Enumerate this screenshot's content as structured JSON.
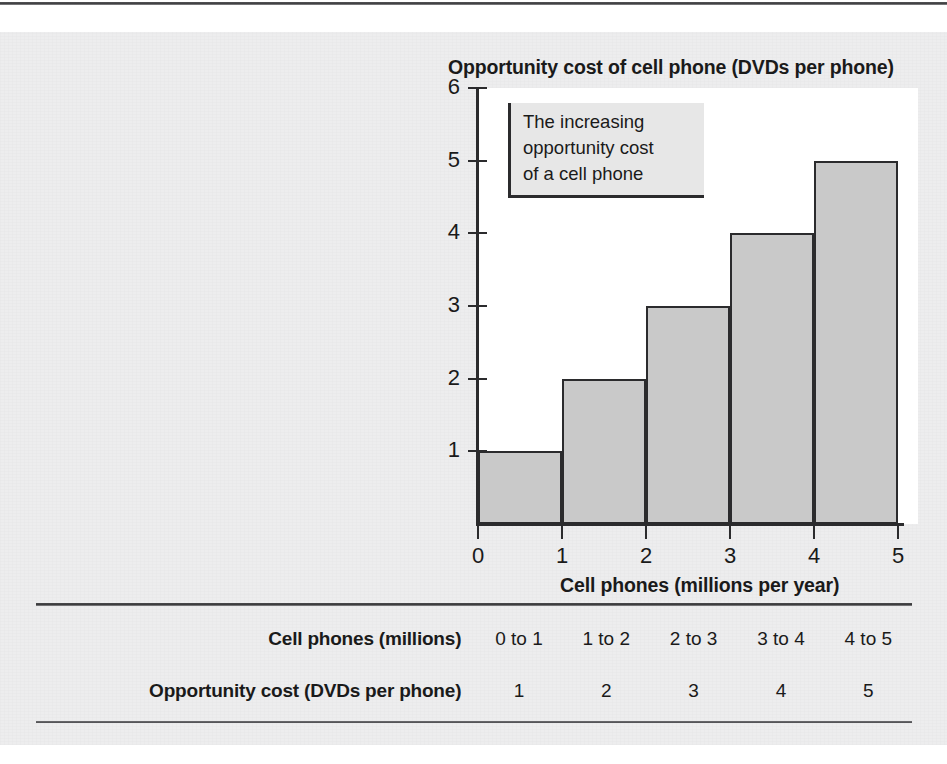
{
  "chart_data": {
    "type": "bar",
    "title": "Opportunity cost of cell phone (DVDs per phone)",
    "xlabel": "Cell phones (millions per year)",
    "ylabel": "Opportunity cost of cell phone (DVDs per phone)",
    "categories": [
      "0 to 1",
      "1 to 2",
      "2 to 3",
      "3 to 4",
      "4 to 5"
    ],
    "values": [
      1,
      2,
      3,
      4,
      5
    ],
    "x_tick_labels": [
      "0",
      "1",
      "2",
      "3",
      "4",
      "5"
    ],
    "y_tick_labels": [
      "0",
      "1",
      "2",
      "3",
      "4",
      "5",
      "6"
    ],
    "xlim": [
      0,
      5
    ],
    "ylim": [
      0,
      6
    ],
    "grid": false,
    "legend": false,
    "bar_fill_color": "#c9c9c9",
    "bar_edge_color": "#2b2b2d",
    "plot_background": "#ffffff",
    "page_background": "#ededee",
    "annotation": {
      "lines": [
        "The increasing",
        "opportunity cost",
        "of a cell phone"
      ],
      "background": "#e7e7e7",
      "border_color": "#2b2b2d"
    }
  },
  "chart": {
    "title": "Opportunity cost of cell phone (DVDs per phone)",
    "x_axis_title": "Cell phones (millions per year)",
    "y_ticks": [
      {
        "label": "6",
        "value": 6
      },
      {
        "label": "5",
        "value": 5
      },
      {
        "label": "4",
        "value": 4
      },
      {
        "label": "3",
        "value": 3
      },
      {
        "label": "2",
        "value": 2
      },
      {
        "label": "1",
        "value": 1
      }
    ],
    "x_ticks": [
      {
        "label": "0",
        "value": 0
      },
      {
        "label": "1",
        "value": 1
      },
      {
        "label": "2",
        "value": 2
      },
      {
        "label": "3",
        "value": 3
      },
      {
        "label": "4",
        "value": 4
      },
      {
        "label": "5",
        "value": 5
      }
    ],
    "bars": [
      {
        "category": "0 to 1",
        "value": 1
      },
      {
        "category": "1 to 2",
        "value": 2
      },
      {
        "category": "2 to 3",
        "value": 3
      },
      {
        "category": "3 to 4",
        "value": 4
      },
      {
        "category": "4 to 5",
        "value": 5
      }
    ],
    "annotation_line_1": "The increasing",
    "annotation_line_2": "opportunity cost",
    "annotation_line_3": "of a cell phone"
  },
  "table": {
    "rows": [
      {
        "label": "Cell phones (millions)",
        "cells": [
          "0 to 1",
          "1 to 2",
          "2 to 3",
          "3 to 4",
          "4 to 5"
        ]
      },
      {
        "label": "Opportunity cost (DVDs per phone)",
        "cells": [
          "1",
          "2",
          "3",
          "4",
          "5"
        ]
      }
    ]
  }
}
